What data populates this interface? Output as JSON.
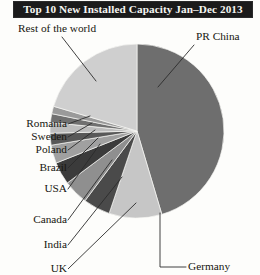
{
  "title": "Top 10 New Installed Capacity Jan–Dec 2013",
  "chart_data": {
    "type": "pie",
    "title": "Top 10 New Installed Capacity Jan–Dec 2013",
    "xlabel": "",
    "ylabel": "",
    "legend_position": "none",
    "labels_position": "outside-with-leader-lines",
    "grid": false,
    "start_angle_deg": 0,
    "direction": "clockwise",
    "categories": [
      "PR China",
      "Germany",
      "UK",
      "India",
      "Canada",
      "USA",
      "Brazil",
      "Poland",
      "Sweden",
      "Romania",
      "Rest of the world"
    ],
    "values": [
      45.4,
      9.8,
      5.0,
      4.6,
      4.2,
      3.4,
      2.2,
      2.0,
      1.6,
      1.4,
      20.4
    ],
    "units": "percent",
    "slices": [
      {
        "label": "PR China",
        "percent": 45.4,
        "color": "#6e6e6e",
        "start_deg": 0.0,
        "end_deg": 163.4
      },
      {
        "label": "Germany",
        "percent": 9.8,
        "color": "#c6c6c6",
        "start_deg": 163.4,
        "end_deg": 198.7
      },
      {
        "label": "UK",
        "percent": 5.0,
        "color": "#4a4a4a",
        "start_deg": 198.7,
        "end_deg": 216.7
      },
      {
        "label": "India",
        "percent": 4.6,
        "color": "#8f8f8f",
        "start_deg": 216.7,
        "end_deg": 233.3
      },
      {
        "label": "Canada",
        "percent": 4.2,
        "color": "#3b3b3b",
        "start_deg": 233.3,
        "end_deg": 248.4
      },
      {
        "label": "USA",
        "percent": 3.4,
        "color": "#a0a0a0",
        "start_deg": 248.4,
        "end_deg": 260.6
      },
      {
        "label": "Brazil",
        "percent": 2.2,
        "color": "#585858",
        "start_deg": 260.6,
        "end_deg": 268.5
      },
      {
        "label": "Poland",
        "percent": 2.0,
        "color": "#bdbdbd",
        "start_deg": 268.5,
        "end_deg": 275.7
      },
      {
        "label": "Sweden",
        "percent": 1.6,
        "color": "#707070",
        "start_deg": 275.7,
        "end_deg": 281.5
      },
      {
        "label": "Romania",
        "percent": 1.4,
        "color": "#9a9a9a",
        "start_deg": 281.5,
        "end_deg": 286.5
      },
      {
        "label": "Rest of the world",
        "percent": 20.4,
        "color": "#cfcfcf",
        "start_deg": 286.5,
        "end_deg": 360.0
      }
    ]
  },
  "labels": {
    "rest_of_world": "Rest of the world",
    "pr_china": "PR China",
    "romania": "Romania",
    "sweden": "Sweden",
    "poland": "Poland",
    "brazil": "Brazil",
    "usa": "USA",
    "canada": "Canada",
    "india": "India",
    "uk": "UK",
    "germany": "Germany"
  },
  "colors": {
    "title_bar_background": "#1b1b1b",
    "title_text": "#f6f6f2",
    "page_background": "#fdfdfb",
    "leader_line": "#2b2b2b",
    "label_text": "#17160f"
  }
}
